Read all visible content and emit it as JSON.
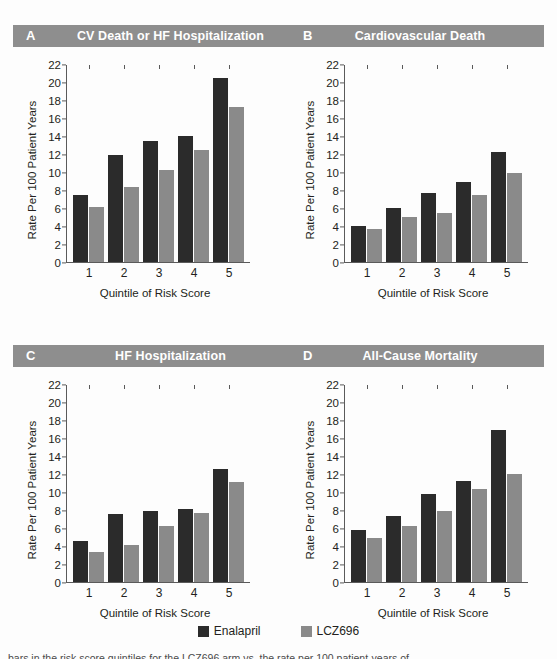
{
  "figure": {
    "legend": {
      "series": [
        {
          "name": "Enalapril",
          "color": "#2b2b2b"
        },
        {
          "name": "LCZ696",
          "color": "#8a8a8a"
        }
      ]
    },
    "caption_partial": "bars in the risk score quintiles for the LCZ696 arm vs. the rate per 100 patient-years of"
  },
  "panels": [
    {
      "letter": "A",
      "title": "CV Death or HF Hospitalization"
    },
    {
      "letter": "B",
      "title": "Cardiovascular Death"
    },
    {
      "letter": "C",
      "title": "HF Hospitalization"
    },
    {
      "letter": "D",
      "title": "All-Cause Mortality"
    }
  ],
  "chart_data": [
    {
      "type": "bar",
      "panel": "A",
      "title": "CV Death or HF Hospitalization",
      "xlabel": "Quintile of Risk Score",
      "ylabel": "Rate Per 100 Patient Years",
      "categories": [
        "1",
        "2",
        "3",
        "4",
        "5"
      ],
      "yticks": [
        0,
        2,
        4,
        6,
        8,
        10,
        12,
        14,
        16,
        18,
        20,
        22
      ],
      "ylim": [
        0,
        22
      ],
      "grid": false,
      "legend_position": "bottom-shared",
      "series": [
        {
          "name": "Enalapril",
          "color": "#2b2b2b",
          "values": [
            7.5,
            11.9,
            13.5,
            14.1,
            20.6
          ]
        },
        {
          "name": "LCZ696",
          "color": "#8a8a8a",
          "values": [
            6.1,
            8.4,
            10.3,
            12.5,
            17.3
          ]
        }
      ]
    },
    {
      "type": "bar",
      "panel": "B",
      "title": "Cardiovascular Death",
      "xlabel": "Quintile of Risk Score",
      "ylabel": "Rate Per 100 Patient Years",
      "categories": [
        "1",
        "2",
        "3",
        "4",
        "5"
      ],
      "yticks": [
        0,
        2,
        4,
        6,
        8,
        10,
        12,
        14,
        16,
        18,
        20,
        22
      ],
      "ylim": [
        0,
        22
      ],
      "grid": false,
      "legend_position": "bottom-shared",
      "series": [
        {
          "name": "Enalapril",
          "color": "#2b2b2b",
          "values": [
            4.0,
            6.0,
            7.7,
            8.9,
            12.3
          ]
        },
        {
          "name": "LCZ696",
          "color": "#8a8a8a",
          "values": [
            3.7,
            5.0,
            5.4,
            7.4,
            9.9
          ]
        }
      ]
    },
    {
      "type": "bar",
      "panel": "C",
      "title": "HF Hospitalization",
      "xlabel": "Quintile of Risk Score",
      "ylabel": "Rate Per 100 Patient Years",
      "categories": [
        "1",
        "2",
        "3",
        "4",
        "5"
      ],
      "yticks": [
        0,
        2,
        4,
        6,
        8,
        10,
        12,
        14,
        16,
        18,
        20,
        22
      ],
      "ylim": [
        0,
        22
      ],
      "grid": false,
      "legend_position": "bottom-shared",
      "series": [
        {
          "name": "Enalapril",
          "color": "#2b2b2b",
          "values": [
            4.5,
            7.6,
            7.9,
            8.1,
            12.6
          ]
        },
        {
          "name": "LCZ696",
          "color": "#8a8a8a",
          "values": [
            3.3,
            4.1,
            6.2,
            7.7,
            11.2
          ]
        }
      ]
    },
    {
      "type": "bar",
      "panel": "D",
      "title": "All-Cause Mortality",
      "xlabel": "Quintile of Risk Score",
      "ylabel": "Rate Per 100 Patient Years",
      "categories": [
        "1",
        "2",
        "3",
        "4",
        "5"
      ],
      "yticks": [
        0,
        2,
        4,
        6,
        8,
        10,
        12,
        14,
        16,
        18,
        20,
        22
      ],
      "ylim": [
        0,
        22
      ],
      "grid": false,
      "legend_position": "bottom-shared",
      "series": [
        {
          "name": "Enalapril",
          "color": "#2b2b2b",
          "values": [
            5.8,
            7.3,
            9.8,
            11.3,
            17.0
          ]
        },
        {
          "name": "LCZ696",
          "color": "#8a8a8a",
          "values": [
            4.9,
            6.2,
            7.9,
            10.4,
            12.0
          ]
        }
      ]
    }
  ]
}
